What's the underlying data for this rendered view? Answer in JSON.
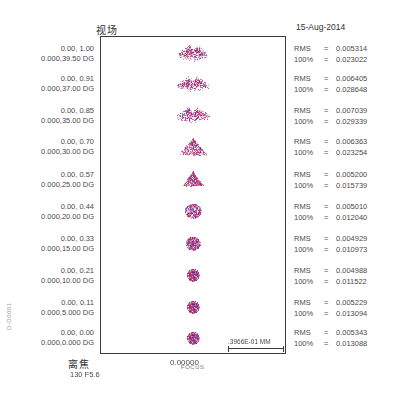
{
  "header": {
    "title_cn": "视场",
    "date": "15-Aug-2014"
  },
  "footer": {
    "title_cn": "离焦",
    "subtitle": "130 F5.6",
    "axis_center_label": "0.00000",
    "axis_unit": "FOCUS",
    "scale_label": ".3966E-01 MM",
    "side_code": "D-D0001"
  },
  "chart_data": {
    "type": "scatter",
    "title": "视场",
    "subtitle": "15-Aug-2014",
    "xlabel": "离焦",
    "ylabel": "",
    "x_center_tick": "0.00000",
    "scale_bar": ".3966E-01 MM",
    "rows": [
      {
        "field_label_line1": "0.00, 1.00",
        "field_label_line2": "0.000,39.50 DG",
        "rms_label": "RMS",
        "rms_value": "0.005314",
        "geo_label": "100%",
        "geo_value": "0.023022",
        "shape": "butterfly",
        "width": 34,
        "height": 20
      },
      {
        "field_label_line1": "0.00, 0.91",
        "field_label_line2": "0.000,37.00 DG",
        "rms_label": "RMS",
        "rms_value": "0.006405",
        "geo_label": "100%",
        "geo_value": "0.028648",
        "shape": "butterfly",
        "width": 36,
        "height": 18
      },
      {
        "field_label_line1": "0.00, 0.85",
        "field_label_line2": "0.000,35.00 DG",
        "rms_label": "RMS",
        "rms_value": "0.007039",
        "geo_label": "100%",
        "geo_value": "0.029339",
        "shape": "butterfly",
        "width": 38,
        "height": 18
      },
      {
        "field_label_line1": "0.00, 0.70",
        "field_label_line2": "0.000,30.00 DG",
        "rms_label": "RMS",
        "rms_value": "0.006363",
        "geo_label": "100%",
        "geo_value": "0.023254",
        "shape": "triangle",
        "width": 30,
        "height": 20
      },
      {
        "field_label_line1": "0.00, 0.57",
        "field_label_line2": "0.000,25.00 DG",
        "rms_label": "RMS",
        "rms_value": "0.005200",
        "geo_label": "100%",
        "geo_value": "0.015739",
        "shape": "triangle",
        "width": 22,
        "height": 18
      },
      {
        "field_label_line1": "0.00, 0.44",
        "field_label_line2": "0.000,20.00 DG",
        "rms_label": "RMS",
        "rms_value": "0.005010",
        "geo_label": "100%",
        "geo_value": "0.012040",
        "shape": "blob",
        "width": 18,
        "height": 16
      },
      {
        "field_label_line1": "0.00, 0.33",
        "field_label_line2": "0.000,15.00 DG",
        "rms_label": "RMS",
        "rms_value": "0.004929",
        "geo_label": "100%",
        "geo_value": "0.010973",
        "shape": "blob",
        "width": 16,
        "height": 15
      },
      {
        "field_label_line1": "0.00, 0.21",
        "field_label_line2": "0.000,10.00 DG",
        "rms_label": "RMS",
        "rms_value": "0.004988",
        "geo_label": "100%",
        "geo_value": "0.011522",
        "shape": "disc",
        "width": 14,
        "height": 14
      },
      {
        "field_label_line1": "0.00, 0.11",
        "field_label_line2": "0.000,5.000 DG",
        "rms_label": "RMS",
        "rms_value": "0.005229",
        "geo_label": "100%",
        "geo_value": "0.013094",
        "shape": "disc",
        "width": 14,
        "height": 14
      },
      {
        "field_label_line1": "0.00, 0.00",
        "field_label_line2": "0.000,0.000 DG",
        "rms_label": "RMS",
        "rms_value": "0.005343",
        "geo_label": "100%",
        "geo_value": "0.013088",
        "shape": "disc",
        "width": 14,
        "height": 14
      }
    ],
    "colors": {
      "spot_magenta": "#c0246e",
      "spot_red": "#d8304a",
      "spot_blue": "#3a2f9e",
      "spot_purple": "#7a2a8c",
      "frame": "#3a3a3a",
      "text": "#4a4a4a"
    }
  }
}
